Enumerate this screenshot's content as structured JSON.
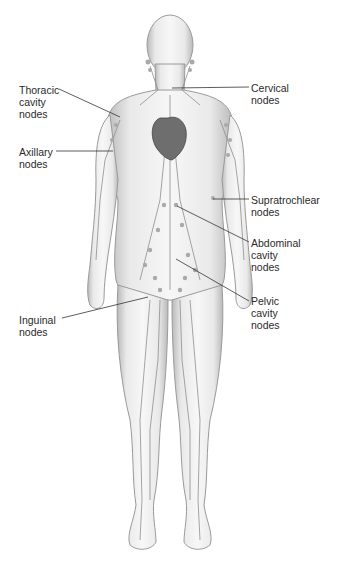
{
  "figure": {
    "colors": {
      "background": "#ffffff",
      "skin_fill": "#eeeeee",
      "skin_edge": "#9a9a9a",
      "vessel": "#8e8e8e",
      "node": "#a9a9a9",
      "heart": "#6e6e6e",
      "leader_line": "#333333",
      "text": "#2a2a2a"
    }
  },
  "labels": [
    {
      "id": "thoracic",
      "text": "Thoracic\ncavity\nnodes",
      "x": 19,
      "y": 84,
      "line": [
        [
          59,
          89
        ],
        [
          120,
          117
        ]
      ]
    },
    {
      "id": "cervical",
      "text": "Cervical\nnodes",
      "x": 251,
      "y": 82,
      "line": [
        [
          249,
          87
        ],
        [
          172,
          88
        ]
      ]
    },
    {
      "id": "axillary",
      "text": "Axillary\nnodes",
      "x": 19,
      "y": 146,
      "line": [
        [
          56,
          151
        ],
        [
          113,
          151
        ]
      ]
    },
    {
      "id": "supratrochlear",
      "text": "Supratrochlear\nnodes",
      "x": 251,
      "y": 194,
      "line": [
        [
          249,
          199
        ],
        [
          213,
          199
        ]
      ]
    },
    {
      "id": "abdominal",
      "text": "Abdominal\ncavity\nnodes",
      "x": 251,
      "y": 237,
      "line": [
        [
          249,
          242
        ],
        [
          177,
          206
        ]
      ]
    },
    {
      "id": "pelvic",
      "text": "Pelvic\ncavity\nnodes",
      "x": 251,
      "y": 295,
      "line": [
        [
          249,
          301
        ],
        [
          176,
          259
        ]
      ]
    },
    {
      "id": "inguinal",
      "text": "Inguinal\nnodes",
      "x": 19,
      "y": 314,
      "line": [
        [
          62,
          318
        ],
        [
          148,
          297
        ]
      ]
    }
  ]
}
